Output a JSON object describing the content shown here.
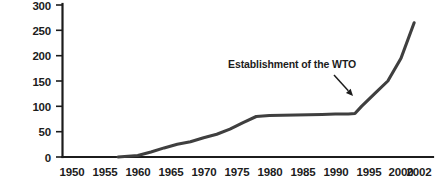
{
  "chart_data": {
    "type": "line",
    "title": "",
    "xlabel": "",
    "ylabel": "",
    "xlim": [
      1948,
      2003
    ],
    "ylim": [
      0,
      300
    ],
    "grid": false,
    "legend": false,
    "y_ticks": [
      "0",
      "50",
      "100",
      "150",
      "200",
      "250",
      "300"
    ],
    "y_tick_values": [
      0,
      50,
      100,
      150,
      200,
      250,
      300
    ],
    "x_ticks": [
      "1950",
      "1955",
      "1960",
      "1965",
      "1970",
      "1975",
      "1980",
      "1985",
      "1990",
      "1995",
      "2000",
      "2002"
    ],
    "x_tick_values": [
      1950,
      1955,
      1960,
      1965,
      1970,
      1975,
      1980,
      1985,
      1990,
      1995,
      2000,
      2002
    ],
    "series": [
      {
        "name": "Cumulative number of regional trade agreements",
        "color": "#3f3f3f",
        "x": [
          1957,
          1958,
          1960,
          1962,
          1964,
          1966,
          1968,
          1970,
          1972,
          1974,
          1976,
          1978,
          1980,
          1984,
          1988,
          1990,
          1992,
          1993,
          1994,
          1996,
          1998,
          2000,
          2002
        ],
        "y": [
          0,
          1,
          3,
          10,
          18,
          25,
          30,
          38,
          45,
          55,
          68,
          80,
          82,
          83,
          84,
          85,
          85,
          86,
          100,
          125,
          150,
          195,
          265
        ]
      }
    ],
    "annotations": [
      {
        "text": "Establishment of the WTO",
        "text_x": 228,
        "text_y": 68,
        "arrow_from_x": 334,
        "arrow_from_y": 75,
        "arrow_to_x": 353,
        "arrow_to_y": 96
      }
    ],
    "colors": {
      "line": "#3f3f3f",
      "axis": "#1c1c1c",
      "text": "#1c1c1c",
      "background": "#ffffff"
    }
  }
}
